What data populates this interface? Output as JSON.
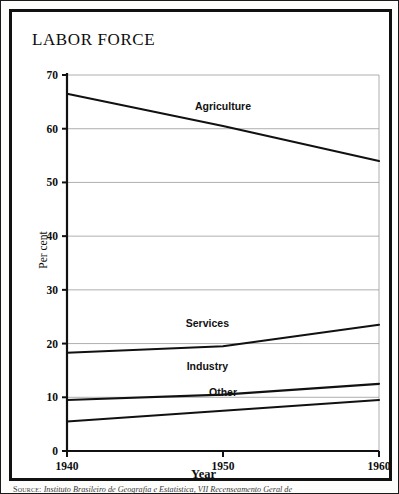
{
  "figure": {
    "title": "LABOR FORCE",
    "source_kicker": "Source:",
    "source_body": "Instituto Brasileiro de Geografia e Estatistica, VII Recenseamento Geral de"
  },
  "chart_data": {
    "type": "line",
    "title": "LABOR FORCE",
    "xlabel": "Year",
    "ylabel": "Per cent",
    "x": [
      1940,
      1950,
      1960
    ],
    "xlim": [
      1940,
      1960
    ],
    "ylim": [
      0,
      70
    ],
    "xtick_labels": [
      "1940",
      "1950",
      "1960"
    ],
    "ytick_labels": [
      "0",
      "10",
      "20",
      "30",
      "40",
      "50",
      "60",
      "70"
    ],
    "yticks": [
      0,
      10,
      20,
      30,
      40,
      50,
      60,
      70
    ],
    "grid": "horizontal",
    "legend": "inline-labels",
    "line_color": "#111111",
    "grid_color": "#9a9a9a",
    "axis_color": "#111111",
    "series": [
      {
        "name": "Agriculture",
        "values": [
          66.5,
          60.5,
          54.0
        ],
        "label_x": 1950,
        "label_y": 63.5
      },
      {
        "name": "Services",
        "values": [
          18.3,
          19.5,
          23.5
        ],
        "label_x": 1949,
        "label_y": 23.0
      },
      {
        "name": "Industry",
        "values": [
          9.5,
          10.5,
          12.5
        ],
        "label_x": 1949,
        "label_y": 15.0
      },
      {
        "name": "Other",
        "values": [
          5.5,
          7.5,
          9.5
        ],
        "label_x": 1950,
        "label_y": 10.2
      }
    ]
  }
}
